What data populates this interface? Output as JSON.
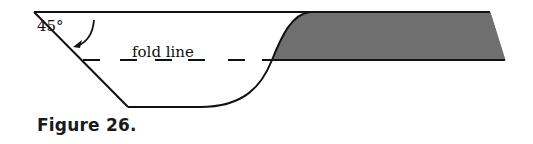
{
  "figure": {
    "caption": "Figure 26.",
    "angle_label": "45°",
    "fold_label": "fold line"
  },
  "colors": {
    "stroke": "#111111",
    "shade": "#6f6f6f",
    "background": "#ffffff"
  }
}
